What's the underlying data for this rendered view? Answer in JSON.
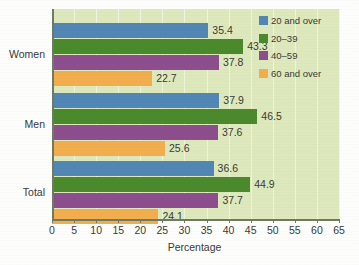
{
  "chart_data": {
    "type": "bar",
    "orientation": "horizontal",
    "title": "",
    "xlabel": "Percentage",
    "ylabel": "",
    "xlim": [
      0,
      65
    ],
    "xticks": [
      0,
      5,
      10,
      15,
      20,
      25,
      30,
      35,
      40,
      45,
      50,
      55,
      60,
      65
    ],
    "grid": "vertical",
    "legend_position": "top-right-inside",
    "categories": [
      "Women",
      "Men",
      "Total"
    ],
    "series": [
      {
        "name": "20 and over",
        "color": "#5186b5",
        "values": [
          35.4,
          37.9,
          36.6
        ]
      },
      {
        "name": "20–39",
        "color": "#4a8a2c",
        "values": [
          43.3,
          46.5,
          44.9
        ]
      },
      {
        "name": "40–59",
        "color": "#8d4e8e",
        "values": [
          37.8,
          37.6,
          37.7
        ]
      },
      {
        "name": "60 and over",
        "color": "#f2ae4e",
        "values": [
          22.7,
          25.6,
          24.1
        ]
      }
    ],
    "value_labels": {
      "Women": [
        "35.4",
        "43.3",
        "37.8",
        "22.7"
      ],
      "Men": [
        "37.9",
        "46.5",
        "37.6",
        "25.6"
      ],
      "Total": [
        "36.6",
        "44.9",
        "37.7",
        "24.1"
      ]
    },
    "plot_background": "#dde8bc",
    "gridline_color": "#f2f6e4",
    "axis_color": "#6f7a62"
  },
  "axis": {
    "x_label": "Percentage",
    "x_tick_labels": [
      "0",
      "5",
      "10",
      "15",
      "20",
      "25",
      "30",
      "35",
      "40",
      "45",
      "50",
      "55",
      "60",
      "65"
    ],
    "y_tick_labels": [
      "Women",
      "Men",
      "Total"
    ]
  },
  "legend": {
    "items": [
      {
        "label": "20 and over",
        "color": "#5186b5"
      },
      {
        "label": "20–39",
        "color": "#4a8a2c"
      },
      {
        "label": "40–59",
        "color": "#8d4e8e"
      },
      {
        "label": "60 and over",
        "color": "#f2ae4e"
      }
    ]
  }
}
